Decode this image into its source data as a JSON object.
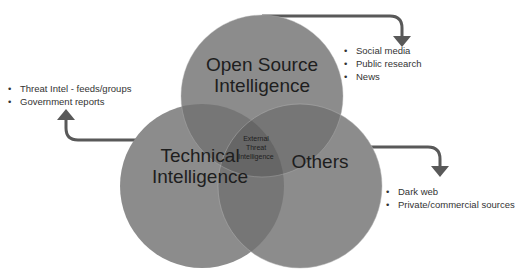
{
  "diagram": {
    "type": "venn",
    "colors": {
      "circle_fill": "#8c8c8c",
      "overlap_fill": "#6e6e6e",
      "arrow": "#595959",
      "text": "#1e1e1e"
    },
    "circles": [
      {
        "id": "osint",
        "label_line1": "Open Source",
        "label_line2": "Intelligence"
      },
      {
        "id": "technical",
        "label_line1": "Technical",
        "label_line2": "Intelligence"
      },
      {
        "id": "others",
        "label_line1": "Others"
      }
    ],
    "center": {
      "line1": "External",
      "line2": "Threat",
      "line3": "Intelligence"
    },
    "callouts": {
      "osint": [
        "Social media",
        "Public research",
        "News"
      ],
      "technical": [
        "Threat Intel - feeds/groups",
        "Government reports"
      ],
      "others": [
        "Dark web",
        "Private/commercial sources"
      ]
    }
  }
}
